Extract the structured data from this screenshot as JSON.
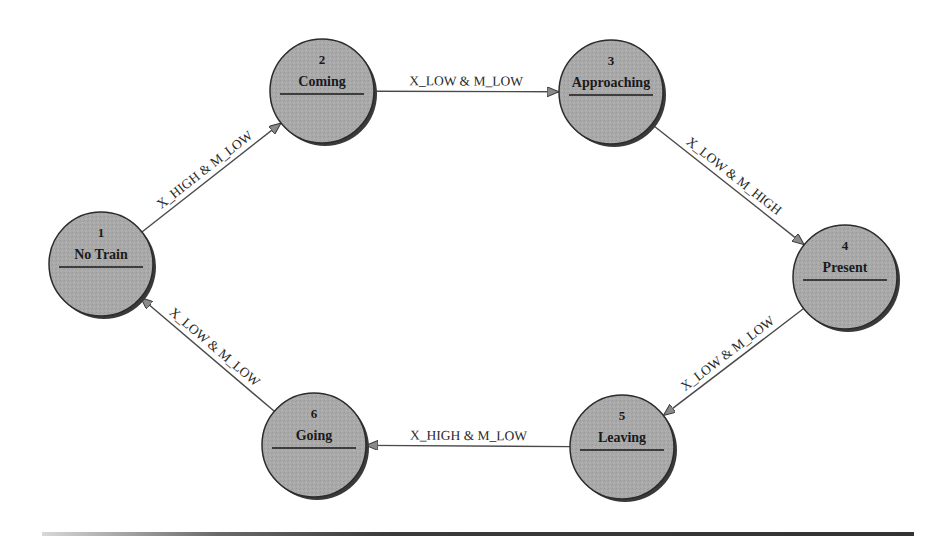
{
  "diagram": {
    "type": "state-machine",
    "colors": {
      "node_fill": "#a8a8a8",
      "node_stroke": "#2b2b2b",
      "node_shadow": "#3a3a3a",
      "edge": "#4a4a4a",
      "arrowhead": "#808080",
      "text": "#1a1a1a"
    },
    "nodes": [
      {
        "id": "1",
        "number": "1",
        "label": "No Train",
        "cx": 101,
        "cy": 264,
        "r": 52
      },
      {
        "id": "2",
        "number": "2",
        "label": "Coming",
        "cx": 322,
        "cy": 91,
        "r": 52
      },
      {
        "id": "3",
        "number": "3",
        "label": "Approaching",
        "cx": 611,
        "cy": 92,
        "r": 52
      },
      {
        "id": "4",
        "number": "4",
        "label": "Present",
        "cx": 845,
        "cy": 277,
        "r": 52
      },
      {
        "id": "5",
        "number": "5",
        "label": "Leaving",
        "cx": 622,
        "cy": 447,
        "r": 52
      },
      {
        "id": "6",
        "number": "6",
        "label": "Going",
        "cx": 314,
        "cy": 445,
        "r": 52
      }
    ],
    "edges": [
      {
        "from": "1",
        "to": "2",
        "label": "X_HIGH & M_LOW"
      },
      {
        "from": "2",
        "to": "3",
        "label": "X_LOW & M_LOW"
      },
      {
        "from": "3",
        "to": "4",
        "label": "X_LOW & M_HIGH"
      },
      {
        "from": "4",
        "to": "5",
        "label": "X_LOW & M_LOW"
      },
      {
        "from": "5",
        "to": "6",
        "label": "X_HIGH & M_LOW"
      },
      {
        "from": "6",
        "to": "1",
        "label": "X_LOW & M_LOW"
      }
    ]
  }
}
